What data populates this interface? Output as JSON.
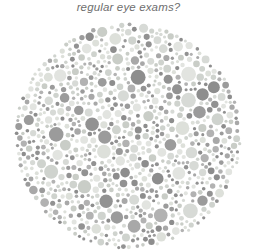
{
  "page": {
    "background_color": "#ffffff",
    "width": 257,
    "height": 252
  },
  "caption": {
    "text": "regular eye exams?",
    "color": "#6e6e6e",
    "style": "italic",
    "align": "center",
    "top": 0
  },
  "plate": {
    "name": "ishihara-color-vision-test-plate",
    "shape": "circle",
    "center_x": 128,
    "center_y": 136,
    "radius": 114,
    "background_color": "#ffffff",
    "dot_min_diameter": 3,
    "dot_max_diameter": 15,
    "palette_light": [
      "#d7dad6",
      "#e2e4e0",
      "#cfd3ce",
      "#dde0da",
      "#c9cdc7"
    ],
    "palette_mid": [
      "#9b9b9b",
      "#a8a8a8",
      "#929292",
      "#b2b2b2",
      "#8d8d8d"
    ],
    "seed": 20240417,
    "dot_count_target": 1050
  }
}
